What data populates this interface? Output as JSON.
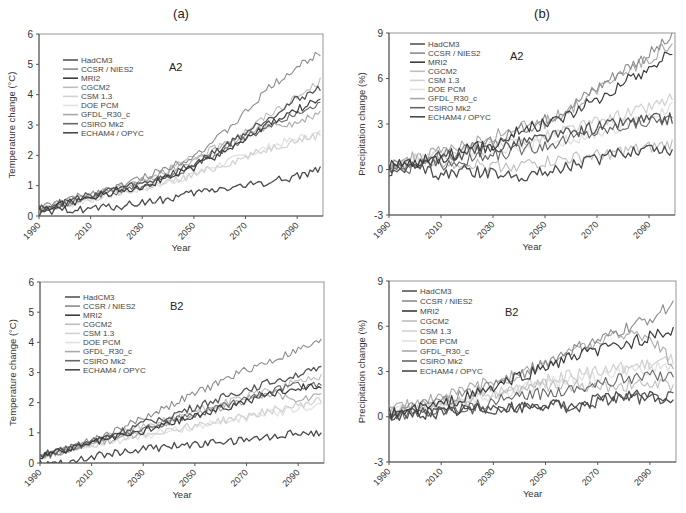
{
  "panel_labels": {
    "a": "(a)",
    "b": "(b)"
  },
  "legend": [
    {
      "name": "HadCM3",
      "color": "#555555",
      "width": 1.3
    },
    {
      "name": "CCSR / NIES2",
      "color": "#8c8c8c",
      "width": 1.1
    },
    {
      "name": "MRI2",
      "color": "#3c3c3c",
      "width": 1.2
    },
    {
      "name": "CGCM2",
      "color": "#bdbdbd",
      "width": 1.1
    },
    {
      "name": "CSM 1.3",
      "color": "#d2d2d2",
      "width": 1.3
    },
    {
      "name": "DOE PCM",
      "color": "#e2e2e2",
      "width": 1.3
    },
    {
      "name": "GFDL_R30_c",
      "color": "#a9a9a9",
      "width": 1.1
    },
    {
      "name": "CSIRO Mk2",
      "color": "#666666",
      "width": 1.1
    },
    {
      "name": "ECHAM4 / OPYC",
      "color": "#4a4a4a",
      "width": 1.3
    }
  ],
  "chart_data": [
    {
      "id": "temp_A2",
      "type": "line",
      "panel": "(a)",
      "scenario": "A2",
      "title": "",
      "xlabel": "Year",
      "ylabel": "Temperature change (°C)",
      "xlim": [
        1990,
        2100
      ],
      "ylim": [
        0,
        6
      ],
      "yticks": [
        0,
        1,
        2,
        3,
        4,
        5,
        6
      ],
      "xticks": [
        "1990",
        "2010",
        "2030",
        "2050",
        "2070",
        "2090"
      ],
      "grid": false,
      "legend_position": "upper left",
      "x": [
        1990,
        2000,
        2010,
        2020,
        2030,
        2040,
        2050,
        2060,
        2070,
        2080,
        2090,
        2100
      ],
      "series": [
        {
          "name": "HadCM3",
          "values": [
            0.25,
            0.45,
            0.7,
            0.9,
            1.05,
            1.35,
            1.7,
            2.2,
            2.75,
            3.3,
            3.85,
            4.25
          ]
        },
        {
          "name": "CCSR / NIES2",
          "values": [
            0.25,
            0.5,
            0.75,
            0.95,
            1.25,
            1.6,
            2.0,
            2.6,
            3.4,
            4.3,
            4.9,
            5.45
          ]
        },
        {
          "name": "MRI2",
          "values": [
            0.25,
            0.4,
            0.6,
            0.85,
            1.0,
            1.25,
            1.6,
            2.05,
            2.55,
            3.05,
            3.5,
            3.95
          ]
        },
        {
          "name": "CGCM2",
          "values": [
            0.25,
            0.45,
            0.65,
            0.9,
            1.2,
            1.55,
            1.9,
            2.3,
            2.8,
            3.4,
            3.9,
            4.5
          ]
        },
        {
          "name": "CSM 1.3",
          "values": [
            0.2,
            0.35,
            0.55,
            0.75,
            0.95,
            1.1,
            1.35,
            1.65,
            1.95,
            2.25,
            2.5,
            2.7
          ]
        },
        {
          "name": "DOE PCM",
          "values": [
            0.2,
            0.35,
            0.55,
            0.75,
            0.9,
            1.1,
            1.4,
            1.7,
            2.0,
            2.3,
            2.55,
            2.75
          ]
        },
        {
          "name": "GFDL_R30_c",
          "values": [
            0.2,
            0.4,
            0.65,
            0.9,
            1.15,
            1.45,
            1.85,
            2.25,
            2.65,
            3.05,
            3.05,
            3.5
          ]
        },
        {
          "name": "CSIRO Mk2",
          "values": [
            0.2,
            0.4,
            0.6,
            0.8,
            1.0,
            1.3,
            1.65,
            2.1,
            2.6,
            3.0,
            3.4,
            3.75
          ]
        },
        {
          "name": "ECHAM4 / OPYC",
          "values": [
            0.05,
            0.2,
            0.25,
            0.3,
            0.45,
            0.55,
            0.75,
            0.9,
            1.0,
            1.15,
            1.3,
            1.6
          ]
        }
      ]
    },
    {
      "id": "precip_A2",
      "type": "line",
      "panel": "(b)",
      "scenario": "A2",
      "title": "",
      "xlabel": "Year",
      "ylabel": "Precipitation change (%)",
      "xlim": [
        1990,
        2100
      ],
      "ylim": [
        -3,
        9
      ],
      "yticks": [
        -3,
        0,
        3,
        6,
        9
      ],
      "xticks": [
        "1990",
        "2010",
        "2030",
        "2050",
        "2070",
        "2090"
      ],
      "grid": false,
      "legend_position": "upper left",
      "x": [
        1990,
        2000,
        2010,
        2020,
        2030,
        2040,
        2050,
        2060,
        2070,
        2080,
        2090,
        2100
      ],
      "series": [
        {
          "name": "HadCM3",
          "values": [
            0.1,
            0.4,
            0.8,
            1.1,
            1.4,
            1.8,
            2.1,
            2.4,
            2.8,
            3.1,
            3.3,
            3.4
          ]
        },
        {
          "name": "CCSR / NIES2",
          "values": [
            0.2,
            0.5,
            0.9,
            1.3,
            1.8,
            2.6,
            3.3,
            4.2,
            5.4,
            6.6,
            7.6,
            8.8
          ]
        },
        {
          "name": "MRI2",
          "values": [
            0.2,
            0.5,
            0.8,
            1.3,
            1.6,
            2.6,
            3.0,
            3.7,
            4.6,
            5.7,
            6.6,
            8.0
          ]
        },
        {
          "name": "CGCM2",
          "values": [
            0.2,
            0.4,
            0.5,
            0.4,
            0.2,
            0.3,
            0.5,
            0.7,
            0.9,
            1.2,
            1.4,
            1.7
          ]
        },
        {
          "name": "CSM 1.3",
          "values": [
            0.2,
            0.6,
            1.0,
            1.2,
            1.5,
            1.8,
            2.2,
            2.7,
            3.1,
            3.6,
            4.1,
            4.8
          ]
        },
        {
          "name": "DOE PCM",
          "values": [
            0.3,
            0.7,
            0.9,
            1.0,
            1.2,
            1.5,
            1.7,
            2.0,
            2.4,
            2.9,
            3.5,
            4.3
          ]
        },
        {
          "name": "GFDL_R30_c",
          "values": [
            0.3,
            0.8,
            1.2,
            1.6,
            2.2,
            2.8,
            3.1,
            4.0,
            5.3,
            6.5,
            7.3,
            8.5
          ]
        },
        {
          "name": "CSIRO Mk2",
          "values": [
            0.0,
            0.2,
            0.3,
            0.6,
            0.9,
            1.3,
            1.6,
            2.1,
            2.5,
            2.9,
            3.2,
            3.4
          ]
        },
        {
          "name": "ECHAM4 / OPYC",
          "values": [
            0.0,
            0.1,
            -0.3,
            -0.1,
            -0.3,
            -0.4,
            -0.2,
            0.3,
            0.7,
            1.1,
            1.5,
            1.2
          ]
        }
      ]
    },
    {
      "id": "temp_B2",
      "type": "line",
      "panel": "(a)",
      "scenario": "B2",
      "title": "",
      "xlabel": "Year",
      "ylabel": "Temperature change (°C)",
      "xlim": [
        1990,
        2100
      ],
      "ylim": [
        0,
        6
      ],
      "yticks": [
        0,
        1,
        2,
        3,
        4,
        5,
        6
      ],
      "xticks": [
        "1990",
        "2010",
        "2030",
        "2050",
        "2070",
        "2090"
      ],
      "grid": false,
      "legend_position": "upper left",
      "x": [
        1990,
        2000,
        2010,
        2020,
        2030,
        2040,
        2050,
        2060,
        2070,
        2080,
        2090,
        2100
      ],
      "series": [
        {
          "name": "HadCM3",
          "values": [
            0.25,
            0.45,
            0.7,
            1.0,
            1.3,
            1.55,
            1.85,
            2.15,
            2.45,
            2.7,
            2.95,
            3.1
          ]
        },
        {
          "name": "CCSR / NIES2",
          "values": [
            0.25,
            0.45,
            0.75,
            1.1,
            1.5,
            1.9,
            2.3,
            2.7,
            3.1,
            3.4,
            3.75,
            4.05
          ]
        },
        {
          "name": "MRI2",
          "values": [
            0.25,
            0.4,
            0.65,
            0.85,
            1.05,
            1.3,
            1.55,
            1.8,
            2.05,
            2.3,
            2.5,
            2.6
          ]
        },
        {
          "name": "CGCM2",
          "values": [
            0.25,
            0.45,
            0.7,
            0.95,
            1.2,
            1.45,
            1.7,
            1.95,
            2.2,
            2.45,
            2.7,
            2.9
          ]
        },
        {
          "name": "CSM 1.3",
          "values": [
            0.2,
            0.4,
            0.6,
            0.8,
            0.95,
            1.1,
            1.25,
            1.4,
            1.55,
            1.75,
            1.9,
            2.1
          ]
        },
        {
          "name": "DOE PCM",
          "values": [
            0.2,
            0.4,
            0.6,
            0.75,
            0.9,
            1.05,
            1.2,
            1.35,
            1.5,
            1.65,
            1.8,
            1.95
          ]
        },
        {
          "name": "GFDL_R30_c",
          "values": [
            0.2,
            0.4,
            0.65,
            0.8,
            1.05,
            1.3,
            1.6,
            1.8,
            2.1,
            2.35,
            2.0,
            2.4
          ]
        },
        {
          "name": "CSIRO Mk2",
          "values": [
            0.25,
            0.45,
            0.75,
            0.95,
            1.15,
            1.35,
            1.6,
            1.9,
            2.15,
            2.4,
            2.55,
            2.6
          ]
        },
        {
          "name": "ECHAM4 / OPYC",
          "values": [
            0.0,
            0.05,
            0.2,
            0.35,
            0.45,
            0.55,
            0.6,
            0.7,
            0.75,
            0.9,
            1.0,
            1.0
          ]
        }
      ]
    },
    {
      "id": "precip_B2",
      "type": "line",
      "panel": "(b)",
      "scenario": "B2",
      "title": "",
      "xlabel": "Year",
      "ylabel": "Precipitation change (%)",
      "xlim": [
        1990,
        2100
      ],
      "ylim": [
        -3,
        9
      ],
      "yticks": [
        -3,
        0,
        3,
        6,
        9
      ],
      "xticks": [
        "1990",
        "2010",
        "2030",
        "2050",
        "2070",
        "2090"
      ],
      "grid": false,
      "legend_position": "upper left",
      "x": [
        1990,
        2000,
        2010,
        2020,
        2030,
        2040,
        2050,
        2060,
        2070,
        2080,
        2090,
        2100
      ],
      "series": [
        {
          "name": "HadCM3",
          "values": [
            0.0,
            0.3,
            0.4,
            0.6,
            0.5,
            0.5,
            0.8,
            0.7,
            1.0,
            1.3,
            1.2,
            1.3
          ]
        },
        {
          "name": "CCSR / NIES2",
          "values": [
            0.2,
            0.6,
            1.0,
            1.5,
            2.1,
            2.8,
            3.6,
            4.4,
            5.0,
            5.8,
            6.5,
            7.6
          ]
        },
        {
          "name": "MRI2",
          "values": [
            0.2,
            0.5,
            0.8,
            1.3,
            1.9,
            2.6,
            3.3,
            3.9,
            4.4,
            4.8,
            5.3,
            5.6
          ]
        },
        {
          "name": "CGCM2",
          "values": [
            0.3,
            0.6,
            0.9,
            1.2,
            1.6,
            1.9,
            2.1,
            2.1,
            2.0,
            2.1,
            2.2,
            2.0
          ]
        },
        {
          "name": "CSM 1.3",
          "values": [
            0.2,
            0.5,
            0.8,
            1.1,
            1.5,
            2.0,
            2.4,
            2.7,
            3.0,
            3.3,
            3.5,
            3.9
          ]
        },
        {
          "name": "DOE PCM",
          "values": [
            0.3,
            0.6,
            0.9,
            1.1,
            1.4,
            1.8,
            2.2,
            2.5,
            2.7,
            3.0,
            3.2,
            3.4
          ]
        },
        {
          "name": "GFDL_R30_c",
          "values": [
            0.5,
            0.9,
            1.4,
            1.8,
            2.4,
            2.8,
            3.5,
            4.3,
            4.9,
            5.5,
            5.4,
            3.2
          ]
        },
        {
          "name": "CSIRO Mk2",
          "values": [
            0.1,
            0.3,
            0.5,
            0.7,
            1.0,
            1.3,
            1.6,
            1.9,
            2.2,
            2.5,
            2.7,
            2.8
          ]
        },
        {
          "name": "ECHAM4 / OPYC",
          "values": [
            0.0,
            0.2,
            0.3,
            0.5,
            0.6,
            0.6,
            0.8,
            0.6,
            1.1,
            1.4,
            1.4,
            1.2
          ]
        }
      ]
    }
  ],
  "layout_panels": [
    {
      "chart": 0,
      "left": 39,
      "top": 34,
      "right": 323,
      "bottom": 216,
      "legend_x": 63,
      "legend_y": 60,
      "legend_step": 9.1,
      "scen_x": 169,
      "scen_y": 71,
      "title_x": 181,
      "title_y": 18,
      "title_key": "a"
    },
    {
      "chart": 1,
      "left": 389,
      "top": 33,
      "right": 675,
      "bottom": 215,
      "legend_x": 410,
      "legend_y": 44,
      "legend_step": 9.1,
      "scen_x": 510,
      "scen_y": 60,
      "title_x": 542,
      "title_y": 18,
      "title_key": "b"
    },
    {
      "chart": 2,
      "left": 40,
      "top": 282,
      "right": 324,
      "bottom": 463,
      "legend_x": 65,
      "legend_y": 297,
      "legend_step": 9.1,
      "scen_x": 170,
      "scen_y": 310,
      "title_x": null
    },
    {
      "chart": 3,
      "left": 389,
      "top": 281,
      "right": 676,
      "bottom": 462,
      "legend_x": 402,
      "legend_y": 291,
      "legend_step": 10,
      "scen_x": 505,
      "scen_y": 316,
      "title_x": null
    }
  ]
}
